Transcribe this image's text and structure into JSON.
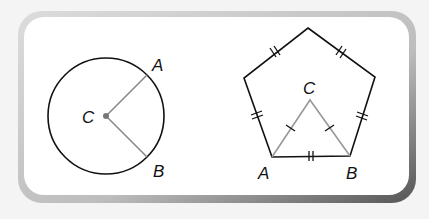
{
  "figure": {
    "left": {
      "title": "circle",
      "center_label": "C",
      "point_a_label": "A",
      "point_b_label": "B",
      "colors": {
        "circle": "#111111",
        "radii": "#888888",
        "center_dot": "#777777"
      }
    },
    "right": {
      "title": "regular pentagon with equilateral triangle",
      "apex_label": "C",
      "vertex_a_label": "A",
      "vertex_b_label": "B",
      "colors": {
        "pentagon": "#111111",
        "triangle": "#999999"
      }
    },
    "frame": {
      "fill": "#ffffff",
      "shadow": "#6a6a6a",
      "light_edge": "#d0d0d0"
    }
  }
}
